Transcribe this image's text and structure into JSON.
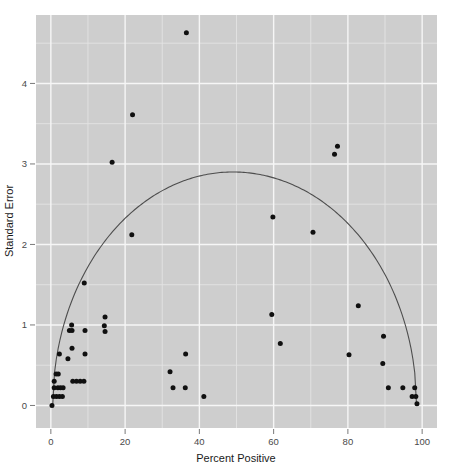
{
  "chart_data": {
    "type": "scatter",
    "title": "",
    "xlabel": "Percent Positive",
    "ylabel": "Standard Error",
    "xlim": [
      -4,
      104
    ],
    "ylim": [
      -0.28,
      4.85
    ],
    "xticks": [
      0,
      20,
      40,
      60,
      80,
      100
    ],
    "xtick_labels": [
      "0",
      "20",
      "40",
      "60",
      "80",
      "100"
    ],
    "yticks": [
      0,
      1,
      2,
      3,
      4
    ],
    "ytick_labels": [
      "0",
      "1",
      "2",
      "3",
      "4"
    ],
    "grid": true,
    "grid_major_color": "#f7f7f7",
    "grid_minor_color": "#e4e4e4",
    "panel_color": "#cfcfcf",
    "point_color": "#101010",
    "curve_color": "#4d4d4d",
    "legend": null,
    "series": [
      {
        "name": "studies",
        "marker": "circle",
        "points": [
          [
            36.5,
            4.63
          ],
          [
            22.0,
            3.61
          ],
          [
            77.2,
            3.22
          ],
          [
            76.4,
            3.12
          ],
          [
            16.5,
            3.02
          ],
          [
            59.8,
            2.34
          ],
          [
            70.6,
            2.15
          ],
          [
            21.8,
            2.12
          ],
          [
            9.0,
            1.52
          ],
          [
            82.8,
            1.24
          ],
          [
            59.5,
            1.13
          ],
          [
            14.6,
            1.1
          ],
          [
            5.6,
            1.0
          ],
          [
            14.4,
            0.99
          ],
          [
            5.0,
            0.93
          ],
          [
            5.7,
            0.93
          ],
          [
            9.2,
            0.93
          ],
          [
            14.6,
            0.92
          ],
          [
            89.6,
            0.86
          ],
          [
            61.8,
            0.77
          ],
          [
            5.7,
            0.71
          ],
          [
            2.3,
            0.64
          ],
          [
            9.2,
            0.64
          ],
          [
            36.3,
            0.64
          ],
          [
            80.3,
            0.63
          ],
          [
            4.6,
            0.58
          ],
          [
            89.4,
            0.52
          ],
          [
            32.1,
            0.42
          ],
          [
            1.4,
            0.39
          ],
          [
            2.0,
            0.39
          ],
          [
            0.9,
            0.3
          ],
          [
            5.9,
            0.3
          ],
          [
            6.9,
            0.3
          ],
          [
            7.9,
            0.3
          ],
          [
            8.9,
            0.3
          ],
          [
            0.9,
            0.22
          ],
          [
            1.9,
            0.22
          ],
          [
            2.6,
            0.22
          ],
          [
            3.3,
            0.22
          ],
          [
            32.9,
            0.22
          ],
          [
            36.2,
            0.22
          ],
          [
            90.9,
            0.22
          ],
          [
            94.8,
            0.22
          ],
          [
            98.0,
            0.22
          ],
          [
            0.7,
            0.11
          ],
          [
            1.5,
            0.11
          ],
          [
            2.3,
            0.11
          ],
          [
            3.1,
            0.11
          ],
          [
            41.2,
            0.11
          ],
          [
            97.3,
            0.11
          ],
          [
            98.3,
            0.11
          ],
          [
            0.3,
            0.0
          ],
          [
            98.6,
            0.02
          ]
        ]
      }
    ],
    "overlay_curve": {
      "name": "funnel-boundary",
      "description": "inverted-U funnel contour",
      "apex_x": 49.0,
      "apex_y": 2.9,
      "x_start": 0.5,
      "x_end": 98.5
    }
  },
  "axes": {
    "x_title": "Percent Positive",
    "y_title": "Standard Error"
  }
}
